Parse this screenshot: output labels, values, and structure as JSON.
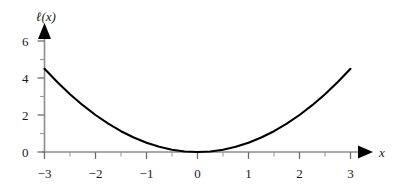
{
  "chart_data": {
    "type": "line",
    "title": "",
    "subtitle": "",
    "xlabel": "x",
    "ylabel": "ℓ(x)",
    "expression": "ℓ(x) = x²/2",
    "xlim": [
      -3.12,
      3.35
    ],
    "ylim": [
      0,
      6.35
    ],
    "grid": false,
    "legend": null,
    "x_ticks": [
      -3,
      -2,
      -1,
      0,
      1,
      2,
      3
    ],
    "x_tick_labels": [
      "−3",
      "−2",
      "−1",
      "0",
      "1",
      "2",
      "3"
    ],
    "x_minor_ticks": [
      -2.5,
      -1.5,
      -0.5,
      0.5,
      1.5,
      2.5
    ],
    "y_ticks": [
      0,
      2,
      4,
      6
    ],
    "y_tick_labels": [
      "0",
      "2",
      "4",
      "6"
    ],
    "y_minor_ticks": [
      1,
      3,
      5
    ],
    "series": [
      {
        "name": "ℓ(x)",
        "color": "#000000",
        "x": [
          -3,
          -2.75,
          -2.5,
          -2.25,
          -2,
          -1.75,
          -1.5,
          -1.25,
          -1,
          -0.75,
          -0.5,
          -0.25,
          0,
          0.25,
          0.5,
          0.75,
          1,
          1.25,
          1.5,
          1.75,
          2,
          2.25,
          2.5,
          2.75,
          3
        ],
        "values": [
          4.5,
          3.781,
          3.125,
          2.531,
          2,
          1.531,
          1.125,
          0.781,
          0.5,
          0.281,
          0.125,
          0.031,
          0,
          0.031,
          0.125,
          0.281,
          0.5,
          0.781,
          1.125,
          1.531,
          2,
          2.531,
          3.125,
          3.781,
          4.5
        ]
      }
    ]
  },
  "style": {
    "axis_color": "#8c8c8c",
    "arrow_color": "#000000",
    "curve_color": "#000000",
    "text_color": "#1a1a1a",
    "background": "#ffffff"
  },
  "icons": {
    "x_axis_arrow": "arrow-right-icon",
    "y_axis_arrow": "arrow-up-icon"
  }
}
